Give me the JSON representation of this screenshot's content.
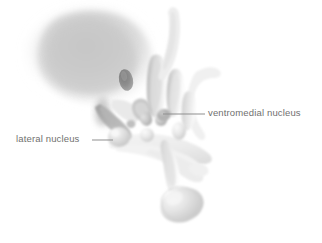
{
  "figure": {
    "kind": "anatomical-illustration",
    "background_color": "#ffffff",
    "width": 322,
    "height": 243
  },
  "labels": [
    {
      "id": "ventromedial",
      "text": "ventromedial nucleus",
      "color": "#70706f",
      "text_x": 208,
      "text_y": 107,
      "leader": {
        "x1": 163,
        "y1": 114,
        "x2": 205,
        "y2": 114
      }
    },
    {
      "id": "lateral",
      "text": "lateral nucleus",
      "color": "#70706f",
      "text_x": 16,
      "text_y": 133,
      "leader": {
        "x1": 92,
        "y1": 140,
        "x2": 113,
        "y2": 140
      }
    }
  ],
  "palette": {
    "background": "#ffffff",
    "mass_core": "#c9c9c9",
    "mass_mid": "#d4d4d4",
    "mass_edge": "#eeeeee",
    "dark_oval": "#8d8d8d",
    "tract_dark": "#a9a9a9",
    "lobe_mid": "#c4c4c4",
    "lobe_light": "#e6e6e6",
    "pale_sheet": "#f1f1f1",
    "outline": "#d9d9d9",
    "leader_line": "#8f8f8f",
    "label_text": "#70706f"
  },
  "structures": [
    {
      "name": "thalamic-mass",
      "note": "large soft-edged gray mass, upper left"
    },
    {
      "name": "dark-oval-nucleus",
      "note": "small darker oval inside mass, lower right of mass"
    },
    {
      "name": "fornix-band",
      "note": "darker diagonal band descending left-to-right"
    },
    {
      "name": "lateral-nucleus-bulb",
      "note": "rounded bulb at end of lateral leader line"
    },
    {
      "name": "paraventricular-lobe",
      "note": "tall elongated lobe, center"
    },
    {
      "name": "finger-lobe-group",
      "note": "cluster of elongated vertical lobes, center-right"
    },
    {
      "name": "ventromedial-nucleus",
      "note": "small rounded nucleus at ventromedial leader tip"
    },
    {
      "name": "small-round-nuclei",
      "note": "several small pale spheres across center"
    },
    {
      "name": "optic-chiasm-sheet",
      "note": "wide pale sweeping sheet, center lower"
    },
    {
      "name": "infundibular-stalk",
      "note": "slender stalk descending to pituitary"
    },
    {
      "name": "pituitary-bulb",
      "note": "pendant rounded bulb at bottom center"
    },
    {
      "name": "upper-stalk",
      "note": "curved pale stalk rising to top right"
    },
    {
      "name": "right-hook",
      "note": "thin pale hooked process, upper right"
    }
  ]
}
